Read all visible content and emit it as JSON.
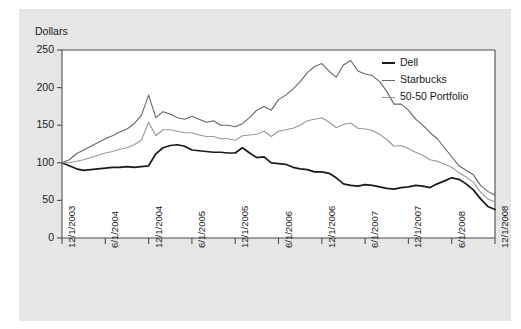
{
  "chart_data": {
    "type": "line",
    "title": "",
    "xlabel": "",
    "ylabel": "Dollars",
    "ylim": [
      0,
      250
    ],
    "yticks": [
      0,
      50,
      100,
      150,
      200,
      250
    ],
    "grid": false,
    "legend_position": "top-right",
    "x_tick_labels": [
      "12/1/2003",
      "6/1/2004",
      "12/1/2004",
      "6/1/2005",
      "12/1/2005",
      "6/1/2006",
      "12/1/2006",
      "6/1/2007",
      "12/1/2007",
      "6/1/2008",
      "12/1/2008"
    ],
    "x": [
      "12/1/2003",
      "1/1/2004",
      "2/1/2004",
      "3/1/2004",
      "4/1/2004",
      "5/1/2004",
      "6/1/2004",
      "7/1/2004",
      "8/1/2004",
      "9/1/2004",
      "10/1/2004",
      "11/1/2004",
      "12/1/2004",
      "1/1/2005",
      "2/1/2005",
      "3/1/2005",
      "4/1/2005",
      "5/1/2005",
      "6/1/2005",
      "7/1/2005",
      "8/1/2005",
      "9/1/2005",
      "10/1/2005",
      "11/1/2005",
      "12/1/2005",
      "1/1/2006",
      "2/1/2006",
      "3/1/2006",
      "4/1/2006",
      "5/1/2006",
      "6/1/2006",
      "7/1/2006",
      "8/1/2006",
      "9/1/2006",
      "10/1/2006",
      "11/1/2006",
      "12/1/2006",
      "1/1/2007",
      "2/1/2007",
      "3/1/2007",
      "4/1/2007",
      "5/1/2007",
      "6/1/2007",
      "7/1/2007",
      "8/1/2007",
      "9/1/2007",
      "10/1/2007",
      "11/1/2007",
      "12/1/2007",
      "1/1/2008",
      "2/1/2008",
      "3/1/2008",
      "4/1/2008",
      "5/1/2008",
      "6/1/2008",
      "7/1/2008",
      "8/1/2008",
      "9/1/2008",
      "10/1/2008",
      "11/1/2008",
      "12/1/2008"
    ],
    "series": [
      {
        "name": "Dell",
        "color": "#1a1a1a",
        "values": [
          100,
          96,
          92,
          90,
          91,
          92,
          93,
          94,
          94,
          95,
          94,
          95,
          96,
          112,
          120,
          123,
          124,
          122,
          117,
          116,
          115,
          114,
          114,
          113,
          113,
          120,
          113,
          107,
          108,
          100,
          99,
          98,
          94,
          92,
          91,
          88,
          88,
          86,
          80,
          72,
          70,
          69,
          71,
          70,
          68,
          66,
          65,
          67,
          68,
          70,
          69,
          67,
          72,
          76,
          80,
          78,
          72,
          64,
          52,
          42,
          38
        ]
      },
      {
        "name": "Starbucks",
        "color": "#666666",
        "values": [
          100,
          104,
          112,
          117,
          122,
          127,
          132,
          136,
          141,
          145,
          152,
          163,
          190,
          160,
          168,
          165,
          160,
          158,
          162,
          158,
          154,
          156,
          150,
          150,
          148,
          152,
          160,
          170,
          175,
          170,
          184,
          190,
          198,
          208,
          220,
          228,
          232,
          222,
          214,
          230,
          236,
          222,
          218,
          216,
          208,
          195,
          178,
          178,
          170,
          158,
          150,
          140,
          132,
          120,
          108,
          96,
          90,
          84,
          70,
          62,
          57
        ]
      },
      {
        "name": "50-50 Portfolio",
        "color": "#999999",
        "values": [
          100,
          100,
          102,
          104,
          107,
          110,
          113,
          115,
          118,
          120,
          124,
          130,
          154,
          136,
          144,
          144,
          142,
          140,
          140,
          137,
          135,
          135,
          132,
          132,
          130,
          136,
          137,
          138,
          142,
          135,
          142,
          144,
          146,
          150,
          156,
          158,
          160,
          154,
          147,
          151,
          153,
          146,
          145,
          143,
          138,
          131,
          122,
          123,
          119,
          114,
          110,
          104,
          102,
          98,
          94,
          87,
          81,
          74,
          61,
          52,
          48
        ]
      }
    ]
  },
  "legend": {
    "entries": [
      {
        "label": "Dell"
      },
      {
        "label": "Starbucks"
      },
      {
        "label": "50-50 Portfolio"
      }
    ]
  }
}
